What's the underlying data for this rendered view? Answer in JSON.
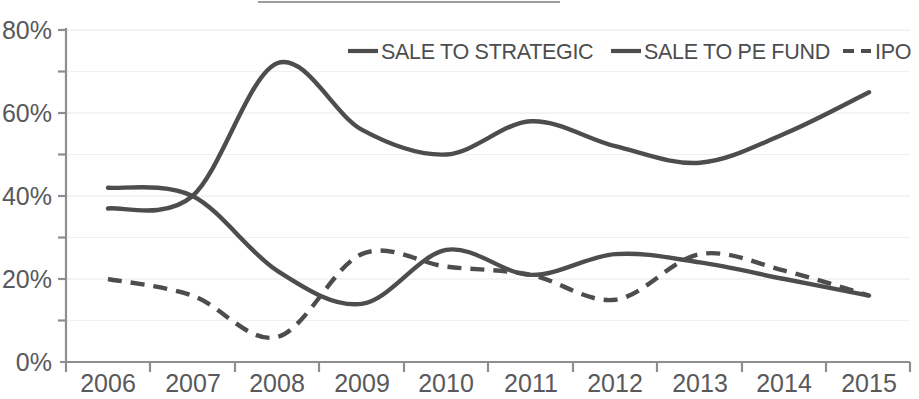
{
  "chart_data": {
    "type": "line",
    "title": "",
    "subtitle": "",
    "xlabel": "",
    "ylabel": "",
    "x": [
      2006,
      2007,
      2008,
      2009,
      2010,
      2011,
      2012,
      2013,
      2014,
      2015
    ],
    "categories": [
      "2006",
      "2007",
      "2008",
      "2009",
      "2010",
      "2011",
      "2012",
      "2013",
      "2014",
      "2015"
    ],
    "xlim": [
      2006,
      2015
    ],
    "ylim": [
      0,
      80
    ],
    "y_tick_labels": [
      "0%",
      "20%",
      "40%",
      "60%",
      "80%"
    ],
    "y_tick_values": [
      0,
      20,
      40,
      60,
      80
    ],
    "y_minor_tick_values": [
      10,
      30,
      50,
      70
    ],
    "grid": true,
    "legend_position": "top-right",
    "value_suffix": "%",
    "series": [
      {
        "name": "SALE TO STRATEGIC",
        "style": "solid",
        "color": "#4d4d4f",
        "values": [
          42,
          40,
          22,
          14,
          27,
          21,
          26,
          24,
          20,
          16
        ]
      },
      {
        "name": "SALE TO PE FUND",
        "style": "solid",
        "color": "#4d4d4f",
        "values": [
          37,
          40,
          72,
          56,
          50,
          58,
          52,
          48,
          55,
          65
        ]
      },
      {
        "name": "IPO",
        "style": "dashed",
        "color": "#4d4d4f",
        "values": [
          20,
          16,
          6,
          26,
          23,
          21,
          15,
          26,
          22,
          16
        ]
      }
    ]
  },
  "legend": {
    "items": [
      {
        "label": "SALE TO STRATEGIC",
        "style": "solid"
      },
      {
        "label": "SALE TO PE FUND",
        "style": "solid"
      },
      {
        "label": "IPO",
        "style": "dashed"
      }
    ]
  },
  "axes": {
    "y_labels": [
      "80%",
      "60%",
      "40%",
      "20%",
      "0%"
    ],
    "x_labels": [
      "2006",
      "2007",
      "2008",
      "2009",
      "2010",
      "2011",
      "2012",
      "2013",
      "2014",
      "2015"
    ]
  }
}
